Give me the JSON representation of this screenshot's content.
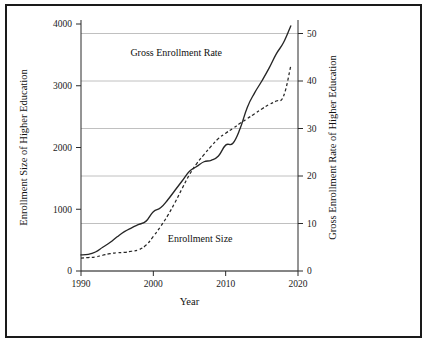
{
  "figure": {
    "background_color": "#ffffff",
    "frame_color": "#1a1a1a",
    "line_color": "#262626",
    "grid_color": "#b9b9b9"
  },
  "chart_data": {
    "type": "line",
    "title": "",
    "xlabel": "Year",
    "ylabel": "Enrollment Size of Higher Education",
    "y2label": "Gross Enrollment Rate of Higher Education",
    "xlim": [
      1990,
      2020
    ],
    "ylim": [
      0,
      4000
    ],
    "y2lim": [
      0,
      52
    ],
    "xticks": [
      1990,
      2000,
      2010,
      2020
    ],
    "xtick_labels": [
      "1990",
      "2000",
      "2010",
      "2020"
    ],
    "yticks": [
      0,
      1000,
      2000,
      3000,
      4000
    ],
    "ytick_labels": [
      "0",
      "1000",
      "2000",
      "3000",
      "4000"
    ],
    "y2ticks": [
      0,
      10,
      20,
      30,
      40,
      50
    ],
    "y2tick_labels": [
      "0",
      "10",
      "20",
      "30",
      "40",
      "50"
    ],
    "grid": "horizontal-on-secondary-axis",
    "legend": "inline-annotations",
    "x": [
      1990,
      1991,
      1992,
      1993,
      1994,
      1995,
      1996,
      1997,
      1998,
      1999,
      2000,
      2001,
      2002,
      2003,
      2004,
      2005,
      2006,
      2007,
      2008,
      2009,
      2010,
      2011,
      2012,
      2013,
      2014,
      2015,
      2016,
      2017,
      2018,
      2019
    ],
    "series": [
      {
        "name": "Enrollment Size",
        "axis": "left",
        "style": "dashed",
        "units": "ten-thousand persons",
        "label_x": 2002.0,
        "label_y": 470,
        "values": [
          210,
          218,
          228,
          255,
          280,
          295,
          302,
          320,
          345,
          420,
          560,
          720,
          900,
          1110,
          1340,
          1560,
          1740,
          1885,
          2021,
          2145,
          2232,
          2309,
          2392,
          2468,
          2548,
          2625,
          2696,
          2753,
          2831,
          3320
        ]
      },
      {
        "name": "Gross Enrollment Rate",
        "axis": "right",
        "style": "solid",
        "units": "percent",
        "label_x": 2009.5,
        "label_y": 45.2,
        "values": [
          3.4,
          3.5,
          4.0,
          5.0,
          6.0,
          7.2,
          8.3,
          9.1,
          9.8,
          10.5,
          12.5,
          13.3,
          15.0,
          17.0,
          19.0,
          21.0,
          22.0,
          23.0,
          23.3,
          24.2,
          26.5,
          26.9,
          30.0,
          34.5,
          37.5,
          40.0,
          42.7,
          45.7,
          48.1,
          51.6
        ]
      }
    ]
  }
}
